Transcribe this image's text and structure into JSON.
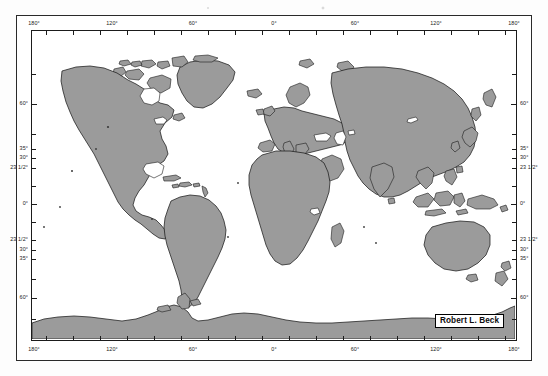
{
  "document": {
    "kind": "world-map-figure",
    "projection_note": "cylindrical world map",
    "land_color": "#9b9b9b",
    "ocean_color": "#ffffff",
    "outline_color": "#1b1b1b",
    "frame_color": "#2a2a2a"
  },
  "credit": {
    "label": "Robert L. Beck"
  },
  "axes": {
    "longitude_top": [
      {
        "label": "180°",
        "value": -180,
        "x_pct": 0
      },
      {
        "label": "120°",
        "value": -120,
        "x_pct": 16.6667
      },
      {
        "label": "60°",
        "value": -60,
        "x_pct": 33.3333
      },
      {
        "label": "0°",
        "value": 0,
        "x_pct": 50
      },
      {
        "label": "60°",
        "value": 60,
        "x_pct": 66.6667
      },
      {
        "label": "120°",
        "value": 120,
        "x_pct": 83.3333
      },
      {
        "label": "180°",
        "value": 180,
        "x_pct": 100
      }
    ],
    "longitude_bottom": [
      {
        "label": "180°",
        "value": -180,
        "x_pct": 0
      },
      {
        "label": "120°",
        "value": -120,
        "x_pct": 16.6667
      },
      {
        "label": "60°",
        "value": -60,
        "x_pct": 33.3333
      },
      {
        "label": "0°",
        "value": 0,
        "x_pct": 50
      },
      {
        "label": "60°",
        "value": 60,
        "x_pct": 66.6667
      },
      {
        "label": "120°",
        "value": 120,
        "x_pct": 83.3333
      },
      {
        "label": "180°",
        "value": 180,
        "x_pct": 100
      }
    ],
    "latitude_left": [
      {
        "label": "60°",
        "value": 60,
        "y_px": 73
      },
      {
        "label": "35°",
        "value": 35,
        "y_px": 118
      },
      {
        "label": "30°",
        "value": 30,
        "y_px": 127
      },
      {
        "label": "23 1/2°",
        "value": 23.5,
        "y_px": 137
      },
      {
        "label": "0°",
        "value": 0,
        "y_px": 173
      },
      {
        "label": "23 1/2°",
        "value": -23.5,
        "y_px": 209
      },
      {
        "label": "30°",
        "value": -30,
        "y_px": 219
      },
      {
        "label": "35°",
        "value": -35,
        "y_px": 228
      },
      {
        "label": "60°",
        "value": -60,
        "y_px": 267
      }
    ],
    "latitude_right": [
      {
        "label": "60°",
        "value": 60,
        "y_px": 73
      },
      {
        "label": "35°",
        "value": 35,
        "y_px": 118
      },
      {
        "label": "30°",
        "value": 30,
        "y_px": 127
      },
      {
        "label": "23 1/2°",
        "value": 23.5,
        "y_px": 137
      },
      {
        "label": "0°",
        "value": 0,
        "y_px": 173
      },
      {
        "label": "23 1/2°",
        "value": -23.5,
        "y_px": 209
      },
      {
        "label": "30°",
        "value": -30,
        "y_px": 219
      },
      {
        "label": "35°",
        "value": -35,
        "y_px": 228
      },
      {
        "label": "60°",
        "value": -60,
        "y_px": 267
      }
    ],
    "minor_tick_interval_deg": 20
  }
}
